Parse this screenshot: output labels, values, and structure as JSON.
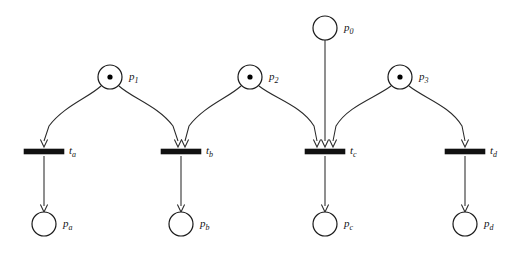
{
  "diagram": {
    "type": "petri-net",
    "width": 524,
    "height": 255,
    "background_color": "#ffffff",
    "stroke_color": "#1a1a1a",
    "token_color": "#000000",
    "transition_color": "#111111"
  },
  "places": [
    {
      "id": "p0",
      "label_base": "p",
      "label_sub": "0",
      "label_full": "p0",
      "tokens": 0,
      "cx": 325,
      "cy": 28,
      "r": 12,
      "label_x": 344,
      "label_y": 31,
      "row": "resource"
    },
    {
      "id": "p1",
      "label_base": "p",
      "label_sub": "1",
      "label_full": "p1",
      "tokens": 1,
      "cx": 110,
      "cy": 77,
      "r": 12,
      "label_x": 129,
      "label_y": 80,
      "row": "input"
    },
    {
      "id": "p2",
      "label_base": "p",
      "label_sub": "2",
      "label_full": "p2",
      "tokens": 1,
      "cx": 250,
      "cy": 77,
      "r": 12,
      "label_x": 269,
      "label_y": 80,
      "row": "input"
    },
    {
      "id": "p3",
      "label_base": "p",
      "label_sub": "3",
      "label_full": "p3",
      "tokens": 1,
      "cx": 400,
      "cy": 77,
      "r": 12,
      "label_x": 419,
      "label_y": 80,
      "row": "input"
    },
    {
      "id": "pa",
      "label_base": "p",
      "label_sub": "a",
      "label_full": "pa",
      "tokens": 0,
      "cx": 44,
      "cy": 224,
      "r": 12,
      "label_x": 63,
      "label_y": 227,
      "row": "output"
    },
    {
      "id": "pb",
      "label_base": "p",
      "label_sub": "b",
      "label_full": "pb",
      "tokens": 0,
      "cx": 181,
      "cy": 224,
      "r": 12,
      "label_x": 200,
      "label_y": 227,
      "row": "output"
    },
    {
      "id": "pc",
      "label_base": "p",
      "label_sub": "c",
      "label_full": "pc",
      "tokens": 0,
      "cx": 325,
      "cy": 224,
      "r": 12,
      "label_x": 344,
      "label_y": 227,
      "row": "output"
    },
    {
      "id": "pd",
      "label_base": "p",
      "label_sub": "d",
      "label_full": "pd",
      "tokens": 0,
      "cx": 465,
      "cy": 224,
      "r": 12,
      "label_x": 484,
      "label_y": 227,
      "row": "output"
    }
  ],
  "transitions": [
    {
      "id": "ta",
      "label_base": "t",
      "label_sub": "a",
      "label_full": "ta",
      "x": 24,
      "y": 149,
      "width": 40,
      "height": 5,
      "label_x": 69,
      "label_y": 154,
      "incoming_count": 1
    },
    {
      "id": "tb",
      "label_base": "t",
      "label_sub": "b",
      "label_full": "tb",
      "x": 161,
      "y": 149,
      "width": 40,
      "height": 5,
      "label_x": 206,
      "label_y": 154,
      "incoming_count": 2
    },
    {
      "id": "tc",
      "label_base": "t",
      "label_sub": "c",
      "label_full": "tc",
      "x": 305,
      "y": 149,
      "width": 40,
      "height": 5,
      "label_x": 350,
      "label_y": 154,
      "incoming_count": 3
    },
    {
      "id": "td",
      "label_base": "t",
      "label_sub": "d",
      "label_full": "td",
      "x": 445,
      "y": 149,
      "width": 40,
      "height": 5,
      "label_x": 490,
      "label_y": 154,
      "incoming_count": 1
    }
  ],
  "arcs": [
    {
      "id": "p1-ta",
      "from": "p1",
      "to": "ta",
      "path": "M 101 86 C 88 98 64 106 49 126 L 44 141",
      "head_x": 44,
      "head_y": 147,
      "shape": "curved"
    },
    {
      "id": "p1-tb",
      "from": "p1",
      "to": "tb",
      "path": "M 119 86 C 132 98 158 106 173 126 L 178 141",
      "head_x": 178,
      "head_y": 147,
      "shape": "curved"
    },
    {
      "id": "p2-tb",
      "from": "p2",
      "to": "tb",
      "path": "M 241 86 C 228 98 204 106 189 126 L 185 141",
      "head_x": 185,
      "head_y": 147,
      "shape": "curved"
    },
    {
      "id": "p2-tc",
      "from": "p2",
      "to": "tc",
      "path": "M 259 86 C 274 98 302 106 314 126 L 317 141",
      "head_x": 317,
      "head_y": 147,
      "shape": "curved"
    },
    {
      "id": "p0-tc",
      "from": "p0",
      "to": "tc",
      "path": "M 325 40 L 325 141",
      "head_x": 325,
      "head_y": 147,
      "shape": "straight"
    },
    {
      "id": "p3-tc",
      "from": "p3",
      "to": "tc",
      "path": "M 391 86 C 375 98 348 106 336 126 L 333 141",
      "head_x": 333,
      "head_y": 147,
      "shape": "curved"
    },
    {
      "id": "p3-td",
      "from": "p3",
      "to": "td",
      "path": "M 409 86 C 424 98 450 106 462 126 L 465 141",
      "head_x": 465,
      "head_y": 147,
      "shape": "curved"
    },
    {
      "id": "ta-pa",
      "from": "ta",
      "to": "pa",
      "path": "M 44 156 L 44 206",
      "head_x": 44,
      "head_y": 212,
      "shape": "straight"
    },
    {
      "id": "tb-pb",
      "from": "tb",
      "to": "pb",
      "path": "M 181 156 L 181 206",
      "head_x": 181,
      "head_y": 212,
      "shape": "straight"
    },
    {
      "id": "tc-pc",
      "from": "tc",
      "to": "pc",
      "path": "M 325 156 L 325 206",
      "head_x": 325,
      "head_y": 212,
      "shape": "straight"
    },
    {
      "id": "td-pd",
      "from": "td",
      "to": "pd",
      "path": "M 465 156 L 465 206",
      "head_x": 465,
      "head_y": 212,
      "shape": "straight"
    }
  ]
}
